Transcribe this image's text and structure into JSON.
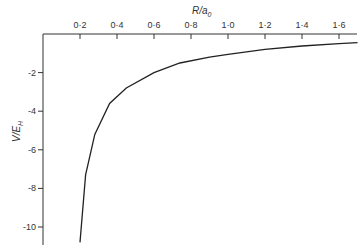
{
  "chart_data": {
    "type": "line",
    "title": "",
    "xlabel": "R/a0",
    "ylabel": "V/E_H",
    "x_axis_position": "top",
    "xlim": [
      0,
      1.72
    ],
    "ylim": [
      -11,
      0
    ],
    "xticks": [
      "0·2",
      "0·4",
      "0·6",
      "0·8",
      "1·0",
      "1·2",
      "1·4",
      "1·6"
    ],
    "yticks": [
      "-2",
      "-4",
      "-6",
      "-8",
      "-10"
    ],
    "grid": false,
    "series": [
      {
        "name": "V",
        "x": [
          0.2,
          0.23,
          0.28,
          0.36,
          0.45,
          0.6,
          0.74,
          0.9,
          1.0,
          1.2,
          1.4,
          1.6,
          1.7
        ],
        "y": [
          -10.8,
          -7.3,
          -5.2,
          -3.6,
          -2.8,
          -2.0,
          -1.5,
          -1.2,
          -1.05,
          -0.8,
          -0.62,
          -0.5,
          -0.45
        ]
      }
    ]
  },
  "labels": {
    "x": "R/a",
    "x_sub": "0",
    "y": "V/E",
    "y_sub": "H"
  }
}
